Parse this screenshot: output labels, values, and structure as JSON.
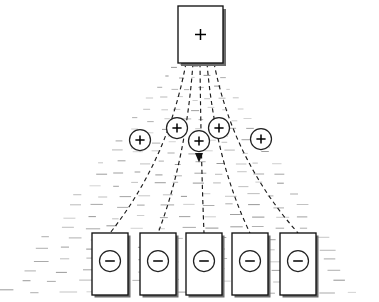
{
  "figure": {
    "width": 302,
    "canvas_width": 379,
    "background_color": "#ffffff",
    "line_color": "#111111",
    "hatch_color": "#8b8b8b"
  },
  "source": {
    "label": "+",
    "sign": "plus",
    "name": "positive-source",
    "x": 178,
    "y": 6,
    "w": 45,
    "h": 57
  },
  "carriers": [
    {
      "label": "+",
      "sign": "plus",
      "cx": 140,
      "cy": 140,
      "r": 10.5,
      "arrow_angle": 55
    },
    {
      "label": "+",
      "sign": "plus",
      "cx": 177,
      "cy": 128,
      "r": 10.5,
      "arrow_angle": 68
    },
    {
      "label": "+",
      "sign": "plus",
      "cx": 199,
      "cy": 141,
      "r": 10.5,
      "arrow_angle": 90
    },
    {
      "label": "+",
      "sign": "plus",
      "cx": 219,
      "cy": 128,
      "r": 10.5,
      "arrow_angle": 112
    },
    {
      "label": "+",
      "sign": "plus",
      "cx": 261,
      "cy": 139,
      "r": 10.5,
      "arrow_angle": 125
    }
  ],
  "sinks": [
    {
      "label": "-",
      "sign": "minus",
      "x": 92,
      "y": 233,
      "w": 36,
      "h": 62,
      "cx": 110,
      "cy": 261,
      "r": 10.5
    },
    {
      "label": "-",
      "sign": "minus",
      "x": 140,
      "y": 233,
      "w": 36,
      "h": 62,
      "cx": 158,
      "cy": 261,
      "r": 10.5
    },
    {
      "label": "-",
      "sign": "minus",
      "x": 186,
      "y": 233,
      "w": 36,
      "h": 62,
      "cx": 204,
      "cy": 261,
      "r": 10.5
    },
    {
      "label": "-",
      "sign": "minus",
      "x": 232,
      "y": 233,
      "w": 36,
      "h": 62,
      "cx": 250,
      "cy": 261,
      "r": 10.5
    },
    {
      "label": "-",
      "sign": "minus",
      "x": 280,
      "y": 233,
      "w": 36,
      "h": 62,
      "cx": 298,
      "cy": 261,
      "r": 10.5
    }
  ],
  "field_lines": [
    {
      "name": "field-line-1",
      "from_x": 186,
      "from_y": 63,
      "to_x": 110,
      "to_y": 233,
      "ctrl_x": 168,
      "ctrl_y": 160
    },
    {
      "name": "field-line-2",
      "from_x": 193,
      "from_y": 63,
      "to_x": 158,
      "to_y": 233,
      "ctrl_x": 186,
      "ctrl_y": 160
    },
    {
      "name": "field-line-3",
      "from_x": 200,
      "from_y": 63,
      "to_x": 204,
      "to_y": 233,
      "ctrl_x": 201,
      "ctrl_y": 160
    },
    {
      "name": "field-line-4",
      "from_x": 207,
      "from_y": 63,
      "to_x": 250,
      "to_y": 233,
      "ctrl_x": 215,
      "ctrl_y": 160
    },
    {
      "name": "field-line-5",
      "from_x": 214,
      "from_y": 63,
      "to_x": 298,
      "to_y": 233,
      "ctrl_x": 233,
      "ctrl_y": 160
    }
  ],
  "hatch_region": {
    "description": "trapezoidal field of short horizontal dashes widening downward",
    "apex_left": 170,
    "apex_right": 230,
    "apex_y": 66,
    "base_left": 0,
    "base_right": 379,
    "base_y": 292,
    "rows": 22
  }
}
